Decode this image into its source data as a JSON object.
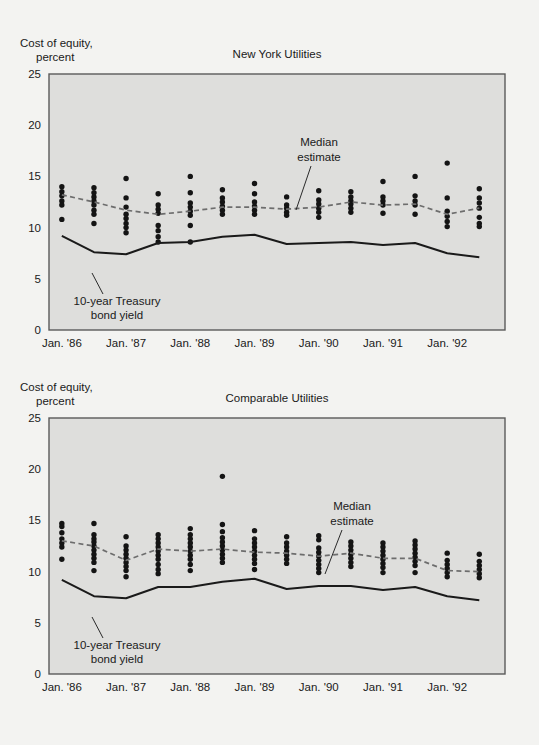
{
  "page": {
    "background": "#f3f3f1",
    "plot_fill": "#dededc"
  },
  "charts": [
    {
      "id": "new-york-utilities",
      "title": "New York Utilities",
      "axis_title_line1": "Cost of equity,",
      "axis_title_line2": "percent",
      "annotations": {
        "median_line1": "Median",
        "median_line2": "estimate",
        "treasury_line1": "10-year Treasury",
        "treasury_line2": "bond yield"
      }
    },
    {
      "id": "comparable-utilities",
      "title": "Comparable Utilities",
      "axis_title_line1": "Cost of equity,",
      "axis_title_line2": "percent",
      "annotations": {
        "median_line1": "Median",
        "median_line2": "estimate",
        "treasury_line1": "10-year Treasury",
        "treasury_line2": "bond yield"
      }
    }
  ],
  "chart_data": [
    {
      "type": "scatter",
      "title": "New York Utilities",
      "xlabel": "",
      "ylabel": "Cost of equity, percent",
      "ylim": [
        0,
        25
      ],
      "yticks": [
        0,
        5,
        10,
        15,
        20,
        25
      ],
      "xticks": [
        "Jan. '86",
        "Jan. '87",
        "Jan. '88",
        "Jan. '89",
        "Jan. '90",
        "Jan. '91",
        "Jan. '92"
      ],
      "xtick_positions": [
        1986.0,
        1987.0,
        1988.0,
        1989.0,
        1990.0,
        1991.0,
        1992.0
      ],
      "xlim": [
        1985.8,
        1992.9
      ],
      "grid": false,
      "legend": "none",
      "series": [
        {
          "name": "Individual estimates",
          "type": "scatter",
          "marker": "filled-circle",
          "color": "#141414",
          "points": [
            {
              "x": 1986.0,
              "values": [
                14.0,
                13.5,
                13.1,
                12.6,
                12.2,
                10.8
              ]
            },
            {
              "x": 1986.5,
              "values": [
                13.9,
                13.4,
                13.0,
                12.6,
                12.2,
                11.7,
                11.3,
                10.4
              ]
            },
            {
              "x": 1987.0,
              "values": [
                14.8,
                12.9,
                12.0,
                11.3,
                10.9,
                10.4,
                10.0,
                9.5
              ]
            },
            {
              "x": 1987.5,
              "values": [
                13.3,
                12.2,
                11.8,
                11.4,
                10.2,
                9.7,
                9.1,
                8.6
              ]
            },
            {
              "x": 1988.0,
              "values": [
                15.0,
                13.4,
                12.4,
                12.0,
                11.6,
                11.2,
                10.2,
                8.6
              ]
            },
            {
              "x": 1988.5,
              "values": [
                13.7,
                12.9,
                12.5,
                12.1,
                11.7,
                11.3
              ]
            },
            {
              "x": 1989.0,
              "values": [
                14.3,
                13.3,
                12.5,
                12.1,
                11.7,
                11.3
              ]
            },
            {
              "x": 1989.5,
              "values": [
                13.0,
                12.2,
                11.9,
                11.5,
                11.2
              ]
            },
            {
              "x": 1990.0,
              "values": [
                13.6,
                12.7,
                12.3,
                11.9,
                11.5,
                11.0
              ]
            },
            {
              "x": 1990.5,
              "values": [
                13.5,
                13.0,
                12.6,
                12.3,
                11.9,
                11.5
              ]
            },
            {
              "x": 1991.0,
              "values": [
                14.5,
                13.0,
                12.6,
                12.2,
                11.4
              ]
            },
            {
              "x": 1991.5,
              "values": [
                15.0,
                13.1,
                12.6,
                12.2,
                11.3
              ]
            },
            {
              "x": 1992.0,
              "values": [
                16.3,
                12.9,
                11.6,
                11.1,
                10.6,
                10.1
              ]
            },
            {
              "x": 1992.5,
              "values": [
                13.8,
                12.9,
                12.4,
                11.9,
                11.0,
                10.4,
                10.1
              ]
            }
          ]
        },
        {
          "name": "Median estimate",
          "type": "line",
          "style": "dashed",
          "color": "#6d6d6d",
          "x": [
            1986.0,
            1986.5,
            1987.0,
            1987.5,
            1988.0,
            1988.5,
            1989.0,
            1989.5,
            1990.0,
            1990.5,
            1991.0,
            1991.5,
            1992.0,
            1992.5
          ],
          "values": [
            13.2,
            12.5,
            11.7,
            11.3,
            11.6,
            12.0,
            12.0,
            11.8,
            12.0,
            12.5,
            12.2,
            12.3,
            11.3,
            11.9
          ]
        },
        {
          "name": "10-year Treasury bond yield",
          "type": "line",
          "style": "solid",
          "color": "#141414",
          "x": [
            1986.0,
            1986.5,
            1987.0,
            1987.5,
            1988.0,
            1988.5,
            1989.0,
            1989.5,
            1990.0,
            1990.5,
            1991.0,
            1991.5,
            1992.0,
            1992.5
          ],
          "values": [
            9.2,
            7.6,
            7.4,
            8.5,
            8.6,
            9.1,
            9.3,
            8.4,
            8.5,
            8.6,
            8.3,
            8.5,
            7.5,
            7.1
          ]
        }
      ]
    },
    {
      "type": "scatter",
      "title": "Comparable Utilities",
      "xlabel": "",
      "ylabel": "Cost of equity, percent",
      "ylim": [
        0,
        25
      ],
      "yticks": [
        0,
        5,
        10,
        15,
        20,
        25
      ],
      "xticks": [
        "Jan. '86",
        "Jan. '87",
        "Jan. '88",
        "Jan. '89",
        "Jan. '90",
        "Jan. '91",
        "Jan. '92"
      ],
      "xtick_positions": [
        1986.0,
        1987.0,
        1988.0,
        1989.0,
        1990.0,
        1991.0,
        1992.0
      ],
      "xlim": [
        1985.8,
        1992.9
      ],
      "grid": false,
      "legend": "none",
      "series": [
        {
          "name": "Individual estimates",
          "type": "scatter",
          "marker": "filled-circle",
          "color": "#141414",
          "points": [
            {
              "x": 1986.0,
              "values": [
                14.7,
                14.4,
                13.8,
                13.2,
                12.8,
                12.4,
                11.2
              ]
            },
            {
              "x": 1986.5,
              "values": [
                14.7,
                13.6,
                13.2,
                12.9,
                12.5,
                12.1,
                11.7,
                11.3,
                10.9,
                10.1
              ]
            },
            {
              "x": 1987.0,
              "values": [
                13.4,
                12.5,
                12.1,
                11.7,
                11.3,
                10.9,
                10.5,
                10.1,
                9.5
              ]
            },
            {
              "x": 1987.5,
              "values": [
                13.6,
                13.2,
                12.8,
                12.4,
                12.0,
                11.6,
                11.2,
                10.7,
                10.2,
                9.8
              ]
            },
            {
              "x": 1988.0,
              "values": [
                14.2,
                13.6,
                13.2,
                12.8,
                12.4,
                12.0,
                11.6,
                11.2,
                10.7,
                10.1
              ]
            },
            {
              "x": 1988.5,
              "values": [
                19.3,
                14.6,
                13.9,
                13.3,
                12.9,
                12.5,
                12.1,
                11.7,
                11.3,
                10.9
              ]
            },
            {
              "x": 1989.0,
              "values": [
                14.0,
                13.2,
                12.8,
                12.4,
                12.0,
                11.6,
                11.2,
                10.8,
                10.2
              ]
            },
            {
              "x": 1989.5,
              "values": [
                13.4,
                12.8,
                12.4,
                12.0,
                11.6,
                11.2,
                10.8
              ]
            },
            {
              "x": 1990.0,
              "values": [
                13.5,
                13.1,
                12.3,
                11.9,
                11.5,
                11.1,
                10.7,
                10.3,
                9.9
              ]
            },
            {
              "x": 1990.5,
              "values": [
                12.9,
                12.5,
                12.1,
                11.7,
                11.3,
                10.9,
                10.5
              ]
            },
            {
              "x": 1991.0,
              "values": [
                12.8,
                12.4,
                12.0,
                11.6,
                11.2,
                10.8,
                10.4,
                9.9
              ]
            },
            {
              "x": 1991.5,
              "values": [
                13.0,
                12.6,
                12.2,
                11.8,
                11.4,
                11.0,
                10.6,
                9.9
              ]
            },
            {
              "x": 1992.0,
              "values": [
                11.8,
                11.1,
                10.7,
                10.3,
                9.9,
                9.5
              ]
            },
            {
              "x": 1992.5,
              "values": [
                11.7,
                11.0,
                10.6,
                10.2,
                9.8,
                9.4
              ]
            }
          ]
        },
        {
          "name": "Median estimate",
          "type": "line",
          "style": "dashed",
          "color": "#6d6d6d",
          "x": [
            1986.0,
            1986.5,
            1987.0,
            1987.5,
            1988.0,
            1988.5,
            1989.0,
            1989.5,
            1990.0,
            1990.5,
            1991.0,
            1991.5,
            1992.0,
            1992.5
          ],
          "values": [
            13.0,
            12.5,
            11.1,
            12.2,
            12.0,
            12.2,
            11.9,
            11.8,
            11.5,
            11.8,
            11.3,
            11.3,
            10.1,
            10.0
          ]
        },
        {
          "name": "10-year Treasury bond yield",
          "type": "line",
          "style": "solid",
          "color": "#141414",
          "x": [
            1986.0,
            1986.5,
            1987.0,
            1987.5,
            1988.0,
            1988.5,
            1989.0,
            1989.5,
            1990.0,
            1990.5,
            1991.0,
            1991.5,
            1992.0,
            1992.5
          ],
          "values": [
            9.2,
            7.6,
            7.4,
            8.5,
            8.5,
            9.0,
            9.3,
            8.3,
            8.6,
            8.6,
            8.2,
            8.5,
            7.6,
            7.2
          ]
        }
      ]
    }
  ]
}
